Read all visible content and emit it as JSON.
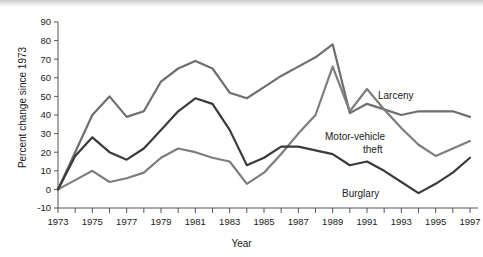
{
  "chart_data": {
    "type": "line",
    "title": "",
    "xlabel": "Year",
    "ylabel": "Percent change since 1973",
    "xlim": [
      1973,
      1997
    ],
    "ylim": [
      -10,
      90
    ],
    "grid": false,
    "legend_position": "inline-right",
    "x": [
      1973,
      1974,
      1975,
      1976,
      1977,
      1978,
      1979,
      1980,
      1981,
      1982,
      1983,
      1984,
      1985,
      1986,
      1987,
      1988,
      1989,
      1990,
      1991,
      1992,
      1993,
      1994,
      1995,
      1996,
      1997
    ],
    "xtick_labels": [
      "1973",
      "1975",
      "1977",
      "1979",
      "1981",
      "1983",
      "1985",
      "1987",
      "1989",
      "1991",
      "1993",
      "1995",
      "1997"
    ],
    "xtick_values": [
      1973,
      1975,
      1977,
      1979,
      1981,
      1983,
      1985,
      1987,
      1989,
      1991,
      1993,
      1995,
      1997
    ],
    "ytick_labels": [
      "-10",
      "0",
      "10",
      "20",
      "30",
      "40",
      "50",
      "60",
      "70",
      "80",
      "90"
    ],
    "ytick_values": [
      -10,
      0,
      10,
      20,
      30,
      40,
      50,
      60,
      70,
      80,
      90
    ],
    "series": [
      {
        "name": "Larceny",
        "color": "#6e6e6e",
        "values": [
          0,
          20,
          40,
          50,
          39,
          42,
          58,
          65,
          69,
          65,
          52,
          49,
          55,
          61,
          66,
          71,
          78,
          41,
          46,
          43,
          40,
          42,
          42,
          42,
          39
        ]
      },
      {
        "name": "Motor-vehicle theft",
        "color": "#7d7d7d",
        "values": [
          0,
          5,
          10,
          4,
          6,
          9,
          17,
          22,
          20,
          17,
          15,
          3,
          9,
          19,
          30,
          40,
          66,
          42,
          54,
          43,
          33,
          24,
          18,
          22,
          26
        ]
      },
      {
        "name": "Burglary",
        "color": "#3a3a3a",
        "values": [
          0,
          18,
          28,
          20,
          16,
          22,
          32,
          42,
          49,
          46,
          32,
          13,
          17,
          23,
          23,
          21,
          19,
          13,
          15,
          10,
          4,
          -2,
          3,
          9,
          17
        ]
      }
    ],
    "annotations": [
      {
        "text": "Larceny",
        "series": "Larceny",
        "x": 378,
        "y": 99
      },
      {
        "text": "Motor-vehicle",
        "series": "Motor-vehicle theft",
        "x": 325,
        "y": 140
      },
      {
        "text": "theft",
        "series": "Motor-vehicle theft",
        "x": 363,
        "y": 153
      },
      {
        "text": "Burglary",
        "series": "Burglary",
        "x": 342,
        "y": 197
      }
    ]
  },
  "axes": {
    "x_title": "Year",
    "y_title": "Percent change since 1973"
  }
}
